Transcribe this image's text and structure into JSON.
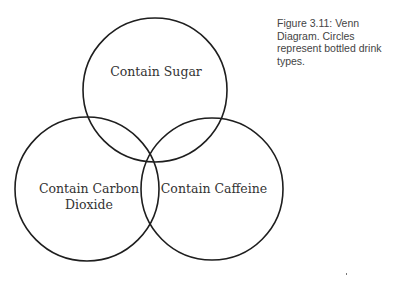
{
  "caption": "Figure 3.11: Venn Diagram. Circles represent bottled drink types.",
  "venn": {
    "sets": [
      {
        "label": "Contain Sugar",
        "cx": 155,
        "cy": 90,
        "r": 72
      },
      {
        "label_line1": "Contain Carbon",
        "label_line2": "Dioxide",
        "cx": 87,
        "cy": 189,
        "r": 72
      },
      {
        "label": "Contain Caffeine",
        "cx": 212,
        "cy": 189,
        "r": 71
      }
    ]
  },
  "colors": {
    "stroke": "#1e1e1e",
    "text": "#333333",
    "background": "#ffffff"
  }
}
